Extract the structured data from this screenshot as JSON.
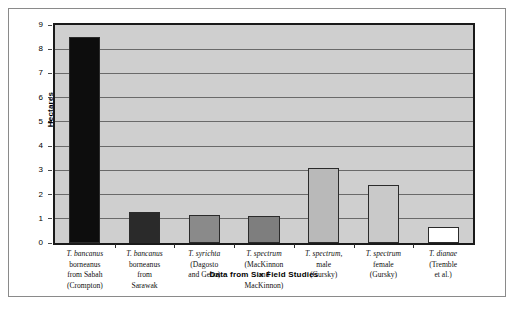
{
  "chart_data": {
    "type": "bar",
    "title": "",
    "xlabel": "Data from Six Field Studies",
    "ylabel": "Hectares",
    "ylim": [
      0,
      9
    ],
    "ytick_labels": [
      "0",
      "1",
      "2",
      "3",
      "4",
      "5",
      "6",
      "7",
      "8",
      "9"
    ],
    "grid": true,
    "legend": "none",
    "categories": [
      "T. bancanus borneanus from Sabah (Crompton)",
      "T. bancanus borneanus from Sarawak",
      "T. syrichta (Dagosto and Gebo)",
      "T. spectrum (MacKinnon and MacKinnon)",
      "T. spectrum, male (Gursky)",
      "T. spectrum female (Gursky)",
      "T. dianae (Tremble et al.)"
    ],
    "category_lines": [
      [
        "T. bancanus",
        "borneanus",
        "from Sabah",
        "(Crompton)"
      ],
      [
        "T. bancanus",
        "borneanus",
        "from",
        "Sarawak"
      ],
      [
        "T. syrichta",
        "(Dagosto",
        "and Gebo)"
      ],
      [
        "T. spectrum",
        "(MacKinnon",
        "and",
        "MacKinnon)"
      ],
      [
        "T. spectrum,",
        "male",
        "(Gursky)"
      ],
      [
        "T. spectrum",
        "female",
        "(Gursky)"
      ],
      [
        "T. dianae",
        "(Tremble",
        "et al.)"
      ]
    ],
    "values": [
      8.5,
      1.3,
      1.15,
      1.1,
      3.1,
      2.4,
      0.65
    ],
    "bar_colors": [
      "#0d0d0d",
      "#2a2a2a",
      "#8a8a8a",
      "#7e7e7e",
      "#b9b9b9",
      "#c9c9c9",
      "#ffffff"
    ],
    "plot_background": "#cfcfcf",
    "gridline_color": "#6a6a6a",
    "axis_color": "#1a1a1a"
  }
}
